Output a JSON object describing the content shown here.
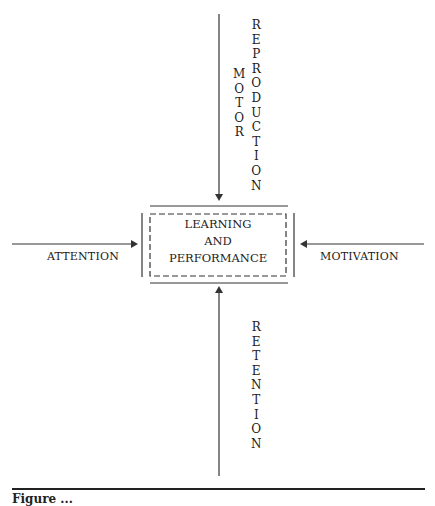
{
  "diagram": {
    "center": {
      "lines": [
        "LEARNING",
        "AND",
        "PERFORMANCE"
      ]
    },
    "inputs": {
      "top": {
        "label_left": "MOTOR",
        "label_right": "REPRODUCTION",
        "direction": "down"
      },
      "left": {
        "label": "ATTENTION",
        "direction": "right"
      },
      "right": {
        "label": "MOTIVATION",
        "direction": "left"
      },
      "bottom": {
        "label": "RETENTION",
        "direction": "up"
      }
    }
  },
  "caption": {
    "text": "Figure ..."
  }
}
